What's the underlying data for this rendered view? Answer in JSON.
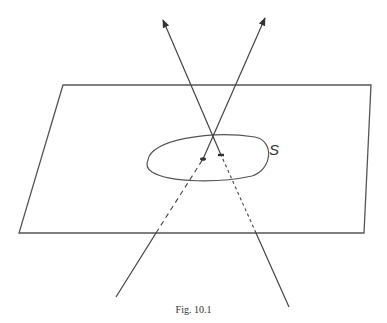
{
  "figure": {
    "caption": "Fig. 10.1",
    "region_label": "S",
    "plane": {
      "corners": [
        [
          63,
          85
        ],
        [
          371,
          85
        ],
        [
          364,
          233
        ],
        [
          19,
          233
        ]
      ],
      "stroke": "#555555"
    },
    "region_outline": {
      "path": "M 148 160 C 150 140, 210 130, 255 137 C 275 141, 272 170, 252 176 C 220 183, 170 183, 152 172 C 146 168, 146 164, 148 160 Z",
      "stroke": "#555555"
    },
    "lines": [
      {
        "name": "line-1",
        "below_start": [
          116,
          297
        ],
        "plane_edge_crossing": [
          156,
          233
        ],
        "pierce_point": [
          203,
          159
        ],
        "arrow_tip": [
          265,
          18
        ]
      },
      {
        "name": "line-2",
        "below_start": [
          289,
          307
        ],
        "plane_edge_crossing": [
          256,
          233
        ],
        "pierce_point": [
          221,
          155
        ],
        "arrow_tip": [
          163,
          20
        ]
      }
    ],
    "line_color": "#444444"
  }
}
